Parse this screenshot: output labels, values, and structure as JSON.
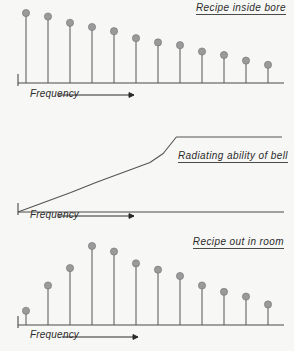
{
  "figure": {
    "caption_style": "italic-underlined",
    "ink_color": "#555555",
    "head_color": "#9a9a9a",
    "background_color": "#f7f7f5"
  },
  "chart_data": [
    {
      "type": "bar",
      "panel_index": 0,
      "title": "Recipe inside bore",
      "xlabel": "Frequency",
      "ylabel": "",
      "grid": false,
      "legend": null,
      "axis_arrow": true,
      "tick_labels": [],
      "categories": [
        "1",
        "2",
        "3",
        "4",
        "5",
        "6",
        "7",
        "8",
        "9",
        "10",
        "11",
        "12"
      ],
      "values": [
        100,
        95,
        86,
        80,
        74,
        64,
        58,
        54,
        45,
        40,
        32,
        26
      ],
      "ylim": [
        0,
        100
      ],
      "note": "harmonic amplitudes decreasing monotonically with frequency"
    },
    {
      "type": "line",
      "panel_index": 1,
      "title": "Radiating ability of bell",
      "xlabel": "Frequency",
      "ylabel": "",
      "grid": false,
      "legend": null,
      "axis_arrow": true,
      "tick_labels": [],
      "x": [
        0,
        10,
        20,
        30,
        40,
        50,
        55,
        60,
        70,
        80,
        90,
        100
      ],
      "values": [
        0,
        13,
        26,
        40,
        53,
        66,
        78,
        100,
        100,
        100,
        100,
        100
      ],
      "ylim": [
        0,
        100
      ],
      "note": "rises linearly from origin then saturates at a plateau"
    },
    {
      "type": "bar",
      "panel_index": 2,
      "title": "Recipe out in room",
      "xlabel": "Frequency",
      "ylabel": "",
      "grid": false,
      "legend": null,
      "axis_arrow": true,
      "tick_labels": [],
      "categories": [
        "1",
        "2",
        "3",
        "4",
        "5",
        "6",
        "7",
        "8",
        "9",
        "10",
        "11",
        "12"
      ],
      "values": [
        18,
        50,
        72,
        100,
        93,
        78,
        70,
        62,
        50,
        42,
        36,
        26
      ],
      "ylim": [
        0,
        100
      ],
      "note": "product of the two panels above: peaks at the 4th partial then falls"
    }
  ]
}
